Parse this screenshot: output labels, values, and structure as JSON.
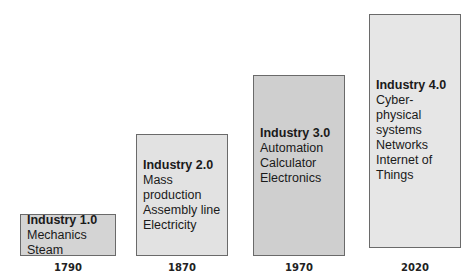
{
  "stages": [
    {
      "title": "Industry 1.0",
      "lines": [
        "Mechanics",
        "Steam"
      ],
      "year": "1790",
      "color": "#d4d4d4"
    },
    {
      "title": "Industry 2.0",
      "lines": [
        "Mass",
        "production",
        "Assembly line",
        "Electricity"
      ],
      "year": "1870",
      "color": "#e2e2e2"
    },
    {
      "title": "Industry 3.0",
      "lines": [
        "Automation",
        "Calculator",
        "Electronics"
      ],
      "year": "1970",
      "color": "#cfcfcf"
    },
    {
      "title": "Industry 4.0",
      "lines": [
        "Cyber-",
        "physical",
        "systems",
        "Networks",
        "Internet of",
        "Things"
      ],
      "year": "2020",
      "color": "#e6e6e6"
    }
  ]
}
